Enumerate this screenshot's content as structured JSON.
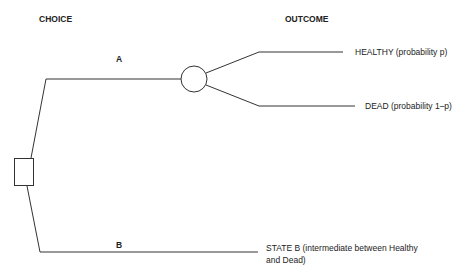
{
  "headers": {
    "choice": "CHOICE",
    "outcome": "OUTCOME"
  },
  "branches": {
    "a": "A",
    "b": "B"
  },
  "outcomes": {
    "healthy": "HEALTHY (probability p)",
    "dead": "DEAD (probability 1–p)",
    "state_b_line1": "STATE B (intermediate between Healthy",
    "state_b_line2": "and Dead)"
  },
  "nodes": {
    "decision": "decision-node-square",
    "chance": "chance-node-circle"
  },
  "colors": {
    "line": "#333333",
    "text": "#222222",
    "background": "#ffffff"
  }
}
